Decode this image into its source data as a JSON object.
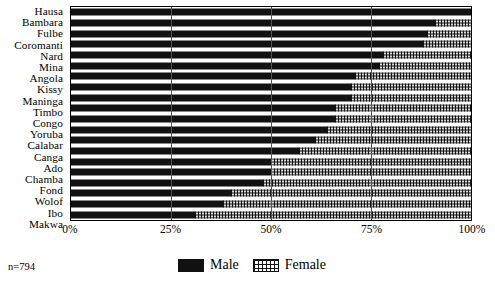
{
  "chart_data": {
    "type": "bar",
    "orientation": "horizontal",
    "stacked": true,
    "normalized": true,
    "title": "",
    "xlabel": "",
    "ylabel": "",
    "xlim": [
      0,
      100
    ],
    "grid": true,
    "legend_position": "bottom-center",
    "x_ticks": [
      "0%",
      "25%",
      "50%",
      "75%",
      "100%"
    ],
    "x_tick_values": [
      0,
      25,
      50,
      75,
      100
    ],
    "categories": [
      "Hausa",
      "Bambara",
      "Fulbe",
      "Coromanti",
      "Nard",
      "Mina",
      "Angola",
      "Kissy",
      "Maninga",
      "Timbo",
      "Congo",
      "Yoruba",
      "Calabar",
      "Canga",
      "Ado",
      "Chamba",
      "Fond",
      "Wolof",
      "Ibo",
      "Makwa"
    ],
    "series": [
      {
        "name": "Male",
        "color": "#111111",
        "pattern": "solid",
        "values": [
          100,
          91,
          89,
          88,
          78,
          77,
          71,
          70,
          70,
          66,
          66,
          64,
          61,
          57,
          50,
          50,
          48,
          40,
          38,
          31
        ]
      },
      {
        "name": "Female",
        "color": "#d8d8d8",
        "pattern": "dotted",
        "values": [
          0,
          9,
          11,
          12,
          22,
          23,
          29,
          30,
          30,
          34,
          34,
          36,
          39,
          43,
          50,
          50,
          52,
          60,
          62,
          69
        ]
      }
    ],
    "annotations": {
      "sample_size": "n=794"
    }
  },
  "legend": {
    "entries": [
      {
        "label": "Male",
        "swatch": "solid-black"
      },
      {
        "label": "Female",
        "swatch": "dotted"
      }
    ]
  },
  "footer": {
    "sample_size": "n=794"
  }
}
